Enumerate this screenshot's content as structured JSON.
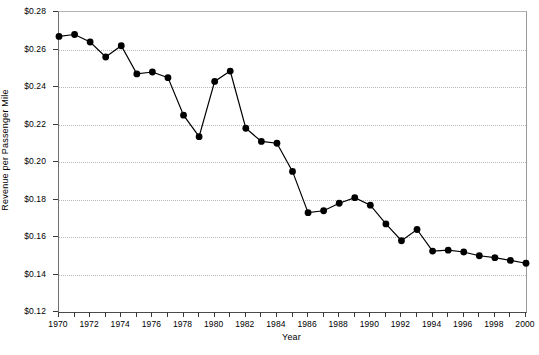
{
  "chart_data": {
    "type": "line",
    "title": "",
    "xlabel": "Year",
    "ylabel": "Revenue per Passenger Mile",
    "xlim": [
      1970,
      2000
    ],
    "ylim": [
      0.12,
      0.28
    ],
    "ytick_step": 0.02,
    "xtick_step": 1,
    "xtick_label_step": 2,
    "grid": "horizontal-dotted",
    "legend": "none",
    "marker": "filled-circle",
    "line_color": "#000000",
    "marker_color": "#000000",
    "grid_color": "#b9b9b9",
    "background": "#ffffff",
    "x": [
      1970,
      1971,
      1972,
      1973,
      1974,
      1975,
      1976,
      1977,
      1978,
      1979,
      1980,
      1981,
      1982,
      1983,
      1984,
      1985,
      1986,
      1987,
      1988,
      1989,
      1990,
      1991,
      1992,
      1993,
      1994,
      1995,
      1996,
      1997,
      1998,
      1999,
      2000
    ],
    "values": [
      0.267,
      0.268,
      0.264,
      0.256,
      0.262,
      0.247,
      0.248,
      0.245,
      0.225,
      0.2135,
      0.243,
      0.2485,
      0.218,
      0.211,
      0.21,
      0.195,
      0.173,
      0.174,
      0.178,
      0.181,
      0.177,
      0.167,
      0.158,
      0.164,
      0.1525,
      0.153,
      0.152,
      0.15,
      0.149,
      0.1475,
      0.146
    ],
    "ytick_labels": [
      "$0.28",
      "$0.26",
      "$0.24",
      "$0.22",
      "$0.20",
      "$0.18",
      "$0.16",
      "$0.14",
      "$0.12"
    ],
    "ytick_values": [
      0.28,
      0.26,
      0.24,
      0.22,
      0.2,
      0.18,
      0.16,
      0.14,
      0.12
    ],
    "xtick_labels": [
      "1970",
      "1972",
      "1974",
      "1976",
      "1978",
      "1980",
      "1982",
      "1984",
      "1986",
      "1988",
      "1990",
      "1992",
      "1994",
      "1996",
      "1998",
      "2000"
    ],
    "xtick_values": [
      1970,
      1972,
      1974,
      1976,
      1978,
      1980,
      1982,
      1984,
      1986,
      1988,
      1990,
      1992,
      1994,
      1996,
      1998,
      2000
    ]
  }
}
